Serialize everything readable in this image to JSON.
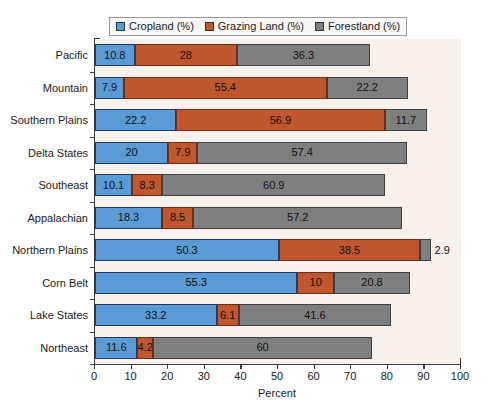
{
  "chart_data": {
    "type": "bar",
    "orientation": "horizontal",
    "stacked": true,
    "title": "",
    "xlabel": "Percent",
    "ylabel": "",
    "xlim": [
      0,
      100
    ],
    "xticks": [
      0,
      10,
      20,
      30,
      40,
      50,
      60,
      70,
      80,
      90,
      100
    ],
    "grid": false,
    "legend_position": "top-center",
    "categories": [
      "Pacific",
      "Mountain",
      "Southern Plains",
      "Delta States",
      "Southeast",
      "Appalachian",
      "Northern Plains",
      "Corn Belt",
      "Lake States",
      "Northeast"
    ],
    "series": [
      {
        "name": "Cropland (%)",
        "color": "#5b9bd5",
        "values": [
          10.8,
          7.9,
          22.2,
          20,
          10.1,
          18.3,
          50.3,
          55.3,
          33.2,
          11.6
        ],
        "labels": [
          "10.8",
          "7.9",
          "22.2",
          "20",
          "10.1",
          "18.3",
          "50.3",
          "55.3",
          "33.2",
          "11.6"
        ]
      },
      {
        "name": "Grazing Land (%)",
        "color": "#c0562e",
        "values": [
          28,
          55.4,
          56.9,
          7.9,
          8.3,
          8.5,
          38.5,
          10,
          6.1,
          4.2
        ],
        "labels": [
          "28",
          "55.4",
          "56.9",
          "7.9",
          "8.3",
          "8.5",
          "38.5",
          "10",
          "6.1",
          "4.2"
        ]
      },
      {
        "name": "Forestland (%)",
        "color": "#7f7f7f",
        "values": [
          36.3,
          22.2,
          11.7,
          57.4,
          60.9,
          57.2,
          2.9,
          20.8,
          41.6,
          60
        ],
        "labels": [
          "36.3",
          "22.2",
          "11.7",
          "57.4",
          "60.9",
          "57.2",
          "2.9",
          "20.8",
          "41.6",
          "60"
        ],
        "labels_outside": [
          false,
          false,
          false,
          false,
          false,
          false,
          true,
          false,
          false,
          false
        ]
      }
    ]
  },
  "legend": {
    "entries": [
      {
        "label": "Cropland (%)",
        "color": "#5b9bd5"
      },
      {
        "label": "Grazing Land (%)",
        "color": "#c0562e"
      },
      {
        "label": "Forestland (%)",
        "color": "#7f7f7f"
      }
    ]
  },
  "axis": {
    "x_title": "Percent",
    "x_tick_labels": [
      "0",
      "10",
      "20",
      "30",
      "40",
      "50",
      "60",
      "70",
      "80",
      "90",
      "100"
    ]
  }
}
